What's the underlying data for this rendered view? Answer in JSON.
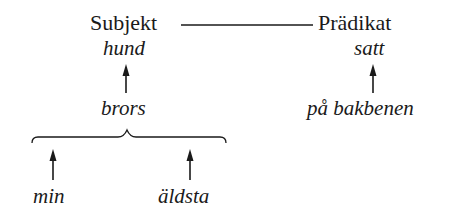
{
  "diagram": {
    "type": "dependency-tree",
    "top": {
      "subject_label": "Subjekt",
      "predicate_label": "Prädikat"
    },
    "heads": {
      "subject_head": "hund",
      "predicate_head": "satt"
    },
    "modifiers": {
      "subject_modifier": "brors",
      "predicate_modifier": "på bakbenen",
      "brors_modifiers": [
        "min",
        "äldsta"
      ]
    },
    "edges": [
      {
        "from": "Subjekt",
        "to": "Prädikat",
        "kind": "line"
      },
      {
        "from": "brors",
        "to": "hund",
        "kind": "arrow"
      },
      {
        "from": "på bakbenen",
        "to": "satt",
        "kind": "arrow"
      },
      {
        "from": "min",
        "to": "brors",
        "kind": "arrow-to-brace"
      },
      {
        "from": "äldsta",
        "to": "brors",
        "kind": "arrow-to-brace"
      }
    ],
    "colors": {
      "ink": "#1a1a1a",
      "background": "#ffffff"
    }
  }
}
